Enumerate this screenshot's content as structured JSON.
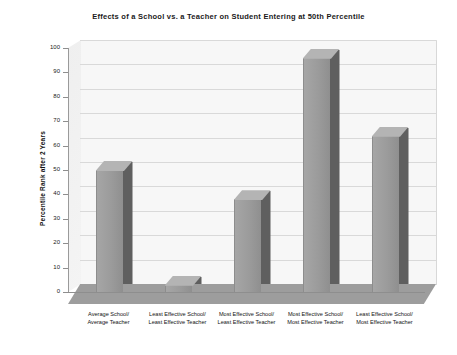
{
  "chart_data": {
    "type": "bar",
    "title": "Effects of a School vs. a Teacher on Student Entering at 50th Percentile",
    "xlabel": "",
    "ylabel": "Percentile Rank after 2 Years",
    "ylim": [
      0,
      100
    ],
    "ytick_step": 10,
    "grid": true,
    "legend": "none",
    "style": "3d-column",
    "bar_color": "#9b9b9b",
    "bar_side_color": "#5f5f5f",
    "bar_top_color": "#b4b4b4",
    "plot_background": "#f7f7f7",
    "floor_color": "#9d9d9d",
    "gridline_color": "#d9d9d9",
    "categories": [
      "Average School/\nAverage Teacher",
      "Least Effective School/\nLeast Effective Teacher",
      "Most Effective School/\nLeast Effective Teacher",
      "Most Effective School/\nMost Effective Teacher",
      "Least Effective School/\nMost Effective Teacher"
    ],
    "category_lines": [
      [
        "Average School/",
        "Average Teacher"
      ],
      [
        "Least Effective School/",
        "Least Effective Teacher"
      ],
      [
        "Most Effective School/",
        "Least Effective Teacher"
      ],
      [
        "Most Effective School/",
        "Most Effective Teacher"
      ],
      [
        "Least Effective School/",
        "Most Effective Teacher"
      ]
    ],
    "values": [
      50,
      3,
      38,
      96,
      64
    ],
    "yticks": [
      0,
      10,
      20,
      30,
      40,
      50,
      60,
      70,
      80,
      90,
      100
    ],
    "ytick_labels": [
      "0",
      "10",
      "20",
      "30",
      "40",
      "50",
      "60",
      "70",
      "80",
      "90",
      "100"
    ]
  }
}
